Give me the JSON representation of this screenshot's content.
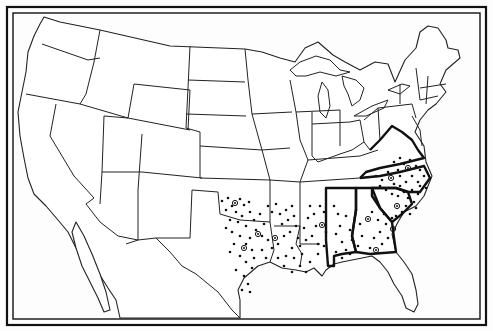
{
  "map": {
    "title": "",
    "subject": "United States outline map with dot distribution across southern states",
    "colors": {
      "ink": "#111111",
      "paper": "#ffffff"
    },
    "highlighted_states": [
      "Virginia",
      "North Carolina",
      "South Carolina",
      "Georgia",
      "Alabama"
    ],
    "dotted_states": [
      "Oklahoma",
      "Texas",
      "Arkansas",
      "Louisiana",
      "Mississippi",
      "Alabama",
      "Georgia",
      "South Carolina",
      "North Carolina",
      "Virginia",
      "Tennessee"
    ],
    "ring_markers": [
      {
        "x": 235,
        "y": 203
      },
      {
        "x": 258,
        "y": 234
      },
      {
        "x": 244,
        "y": 248
      },
      {
        "x": 275,
        "y": 238
      },
      {
        "x": 322,
        "y": 225
      },
      {
        "x": 368,
        "y": 219
      },
      {
        "x": 397,
        "y": 206
      },
      {
        "x": 393,
        "y": 229
      },
      {
        "x": 376,
        "y": 250
      },
      {
        "x": 391,
        "y": 178
      },
      {
        "x": 408,
        "y": 168
      }
    ],
    "dots": [
      [
        222,
        201
      ],
      [
        228,
        198
      ],
      [
        232,
        206
      ],
      [
        240,
        199
      ],
      [
        244,
        205
      ],
      [
        249,
        202
      ],
      [
        226,
        210
      ],
      [
        236,
        212
      ],
      [
        242,
        216
      ],
      [
        250,
        212
      ],
      [
        230,
        220
      ],
      [
        238,
        222
      ],
      [
        246,
        226
      ],
      [
        254,
        220
      ],
      [
        260,
        214
      ],
      [
        264,
        224
      ],
      [
        268,
        206
      ],
      [
        272,
        212
      ],
      [
        276,
        204
      ],
      [
        280,
        214
      ],
      [
        256,
        230
      ],
      [
        262,
        236
      ],
      [
        268,
        240
      ],
      [
        250,
        238
      ],
      [
        240,
        236
      ],
      [
        246,
        244
      ],
      [
        252,
        250
      ],
      [
        240,
        256
      ],
      [
        246,
        262
      ],
      [
        252,
        268
      ],
      [
        236,
        270
      ],
      [
        244,
        276
      ],
      [
        254,
        258
      ],
      [
        262,
        250
      ],
      [
        266,
        258
      ],
      [
        272,
        248
      ],
      [
        278,
        244
      ],
      [
        284,
        236
      ],
      [
        282,
        224
      ],
      [
        288,
        220
      ],
      [
        286,
        210
      ],
      [
        292,
        206
      ],
      [
        294,
        216
      ],
      [
        296,
        226
      ],
      [
        290,
        232
      ],
      [
        298,
        238
      ],
      [
        300,
        246
      ],
      [
        292,
        248
      ],
      [
        286,
        256
      ],
      [
        294,
        258
      ],
      [
        302,
        254
      ],
      [
        306,
        240
      ],
      [
        304,
        228
      ],
      [
        308,
        218
      ],
      [
        310,
        206
      ],
      [
        314,
        214
      ],
      [
        316,
        226
      ],
      [
        312,
        236
      ],
      [
        318,
        244
      ],
      [
        320,
        206
      ],
      [
        324,
        212
      ],
      [
        326,
        232
      ],
      [
        324,
        246
      ],
      [
        318,
        254
      ],
      [
        310,
        262
      ],
      [
        300,
        266
      ],
      [
        306,
        272
      ],
      [
        292,
        272
      ],
      [
        284,
        266
      ],
      [
        278,
        258
      ],
      [
        334,
        206
      ],
      [
        338,
        214
      ],
      [
        340,
        226
      ],
      [
        336,
        234
      ],
      [
        342,
        242
      ],
      [
        346,
        250
      ],
      [
        336,
        252
      ],
      [
        346,
        216
      ],
      [
        350,
        230
      ],
      [
        352,
        240
      ],
      [
        356,
        210
      ],
      [
        360,
        224
      ],
      [
        358,
        246
      ],
      [
        350,
        254
      ],
      [
        342,
        258
      ],
      [
        362,
        236
      ],
      [
        372,
        212
      ],
      [
        378,
        220
      ],
      [
        384,
        214
      ],
      [
        386,
        224
      ],
      [
        380,
        232
      ],
      [
        374,
        238
      ],
      [
        388,
        238
      ],
      [
        392,
        218
      ],
      [
        370,
        248
      ],
      [
        382,
        244
      ],
      [
        398,
        196
      ],
      [
        404,
        192
      ],
      [
        400,
        186
      ],
      [
        408,
        198
      ],
      [
        412,
        190
      ],
      [
        414,
        202
      ],
      [
        406,
        206
      ],
      [
        418,
        194
      ],
      [
        420,
        186
      ],
      [
        402,
        212
      ],
      [
        410,
        214
      ],
      [
        416,
        208
      ],
      [
        396,
        216
      ],
      [
        376,
        176
      ],
      [
        382,
        180
      ],
      [
        388,
        172
      ],
      [
        394,
        184
      ],
      [
        400,
        176
      ],
      [
        406,
        182
      ],
      [
        412,
        176
      ],
      [
        418,
        182
      ],
      [
        424,
        176
      ],
      [
        386,
        190
      ],
      [
        392,
        194
      ],
      [
        398,
        170
      ],
      [
        404,
        164
      ],
      [
        410,
        160
      ],
      [
        416,
        166
      ],
      [
        400,
        158
      ],
      [
        394,
        162
      ],
      [
        420,
        170
      ],
      [
        426,
        188
      ],
      [
        380,
        186
      ],
      [
        226,
        228
      ],
      [
        232,
        232
      ],
      [
        234,
        244
      ],
      [
        230,
        252
      ],
      [
        248,
        284
      ],
      [
        242,
        290
      ],
      [
        250,
        292
      ]
    ]
  }
}
